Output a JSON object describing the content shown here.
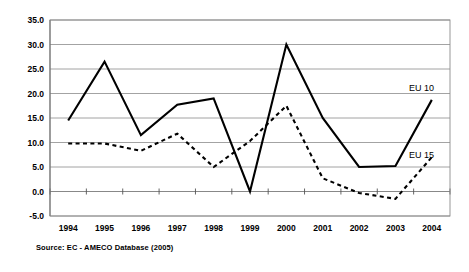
{
  "figure": {
    "source_note": "Source:  EC - AMECO Database (2005)"
  },
  "axis": {
    "y_labels": [
      "35.0",
      "30.0",
      "25.0",
      "20.0",
      "15.0",
      "10.0",
      "5.0",
      "0.0",
      "-5.0"
    ],
    "x_labels": [
      "1994",
      "1995",
      "1996",
      "1997",
      "1998",
      "1999",
      "2000",
      "2001",
      "2002",
      "2003",
      "2004"
    ]
  },
  "legend": {
    "eu10": "EU 10",
    "eu15": "EU 15"
  },
  "chart_data": {
    "type": "line",
    "title": "",
    "subtitle": "",
    "xlabel": "",
    "ylabel": "",
    "categories": [
      "1994",
      "1995",
      "1996",
      "1997",
      "1998",
      "1999",
      "2000",
      "2001",
      "2002",
      "2003",
      "2004"
    ],
    "x": [
      1994,
      1995,
      1996,
      1997,
      1998,
      1999,
      2000,
      2001,
      2002,
      2003,
      2004
    ],
    "series": [
      {
        "name": "EU 10",
        "style": "solid",
        "color": "#000000",
        "values": [
          14.5,
          26.5,
          11.5,
          17.7,
          19.0,
          0.0,
          30.0,
          15.0,
          5.0,
          5.2,
          18.7
        ]
      },
      {
        "name": "EU 15",
        "style": "dashed",
        "color": "#000000",
        "values": [
          9.8,
          9.8,
          8.3,
          11.8,
          5.0,
          10.3,
          17.5,
          2.7,
          -0.3,
          -1.5,
          7.0
        ]
      }
    ],
    "ylim": [
      -5.0,
      35.0
    ],
    "yticks": [
      -5.0,
      0.0,
      5.0,
      10.0,
      15.0,
      20.0,
      25.0,
      30.0,
      35.0
    ],
    "grid": true,
    "grid_axis": "y",
    "legend_position": "inline-right",
    "annotations": [
      {
        "text": "EU 10",
        "x": 2004,
        "y": 22.0
      },
      {
        "text": "EU 15",
        "x": 2004,
        "y": 10.6
      }
    ]
  }
}
